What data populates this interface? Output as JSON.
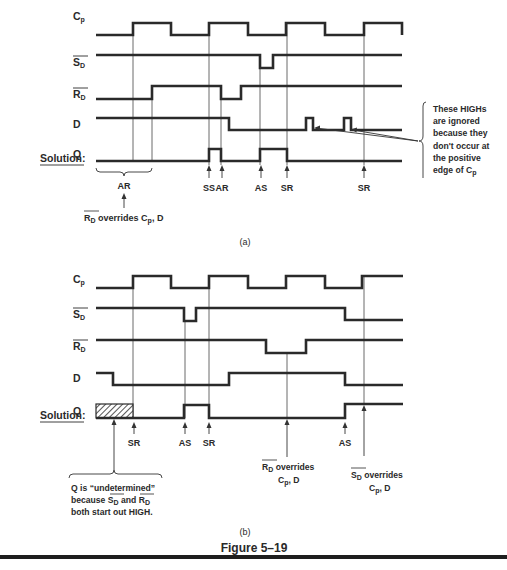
{
  "figure_title": "Figure 5–19",
  "colors": {
    "ink": "#2a2a2a",
    "background": "#ffffff"
  },
  "part_a": {
    "caption": "(a)",
    "solution_label": "Solution:",
    "signals": [
      {
        "name": "Cp",
        "label_main": "C",
        "label_sub": "p",
        "overbar": false,
        "label_y": 20,
        "points": [
          [
            96,
            35
          ],
          [
            133,
            35
          ],
          [
            133,
            23
          ],
          [
            171,
            23
          ],
          [
            171,
            35
          ],
          [
            209,
            35
          ],
          [
            209,
            23
          ],
          [
            248,
            23
          ],
          [
            248,
            35
          ],
          [
            286,
            35
          ],
          [
            286,
            23
          ],
          [
            325,
            23
          ],
          [
            325,
            35
          ],
          [
            364,
            35
          ],
          [
            364,
            23
          ],
          [
            402,
            23
          ],
          [
            402,
            35
          ]
        ]
      },
      {
        "name": "SD_bar",
        "label_main": "S",
        "label_sub": "D",
        "overbar": true,
        "label_y": 66,
        "points": [
          [
            96,
            55
          ],
          [
            260,
            55
          ],
          [
            260,
            68
          ],
          [
            273,
            68
          ],
          [
            273,
            55
          ],
          [
            402,
            55
          ]
        ]
      },
      {
        "name": "RD_bar",
        "label_main": "R",
        "label_sub": "D",
        "overbar": true,
        "label_y": 98,
        "points": [
          [
            96,
            99
          ],
          [
            152,
            99
          ],
          [
            152,
            86
          ],
          [
            221,
            86
          ],
          [
            221,
            99
          ],
          [
            241,
            99
          ],
          [
            241,
            86
          ],
          [
            402,
            86
          ]
        ]
      },
      {
        "name": "D",
        "label_main": "D",
        "label_sub": "",
        "overbar": false,
        "label_y": 128,
        "points": [
          [
            96,
            118
          ],
          [
            229,
            118
          ],
          [
            229,
            130
          ],
          [
            306,
            130
          ],
          [
            306,
            118
          ],
          [
            313,
            118
          ],
          [
            313,
            130
          ],
          [
            344,
            130
          ],
          [
            344,
            118
          ],
          [
            351,
            118
          ],
          [
            351,
            130
          ],
          [
            402,
            130
          ]
        ]
      },
      {
        "name": "Q",
        "label_main": "Q",
        "label_sub": "",
        "overbar": false,
        "label_y": 158,
        "points": [
          [
            96,
            161
          ],
          [
            209,
            161
          ],
          [
            209,
            149
          ],
          [
            221,
            149
          ],
          [
            221,
            161
          ],
          [
            260,
            161
          ],
          [
            260,
            149
          ],
          [
            287,
            149
          ],
          [
            287,
            161
          ],
          [
            402,
            161
          ]
        ]
      }
    ],
    "guides": [
      {
        "x": 133,
        "y1": 35,
        "y2": 161
      },
      {
        "x": 152,
        "y1": 99,
        "y2": 161
      },
      {
        "x": 209,
        "y1": 23,
        "y2": 165
      },
      {
        "x": 221,
        "y1": 99,
        "y2": 165
      },
      {
        "x": 260,
        "y1": 68,
        "y2": 165
      },
      {
        "x": 287,
        "y1": 23,
        "y2": 165
      },
      {
        "x": 364,
        "y1": 23,
        "y2": 165
      }
    ],
    "event_labels": [
      {
        "text": "SS",
        "x": 209,
        "arrow_y1": 178,
        "arrow_y2": 165,
        "label_y": 191
      },
      {
        "text": "AR",
        "x": 222,
        "arrow_y1": 178,
        "arrow_y2": 165,
        "label_y": 191
      },
      {
        "text": "AS",
        "x": 261,
        "arrow_y1": 178,
        "arrow_y2": 165,
        "label_y": 191
      },
      {
        "text": "SR",
        "x": 287,
        "arrow_y1": 178,
        "arrow_y2": 165,
        "label_y": 191
      },
      {
        "text": "SR",
        "x": 364,
        "arrow_y1": 178,
        "arrow_y2": 165,
        "label_y": 191
      }
    ],
    "brace_ar": {
      "x1": 96,
      "x2": 152,
      "y": 172,
      "label": "AR",
      "label_y": 187
    },
    "rd_override_note": {
      "main": "R",
      "sub": "D",
      "text": " overrides C",
      "text_sub": "p",
      "tail": ", D",
      "arrow_x": 124
    },
    "ignored_note": {
      "lines": [
        "These HIGHs",
        "are ignored",
        "because they",
        "don't occur at",
        "the positive",
        "edge of C"
      ],
      "last_sub": "p"
    }
  },
  "part_b": {
    "caption": "(b)",
    "solution_label": "Solution:",
    "signals": [
      {
        "name": "Cp",
        "label_main": "C",
        "label_sub": "p",
        "overbar": false,
        "label_y": 283,
        "points": [
          [
            96,
            288
          ],
          [
            133,
            288
          ],
          [
            133,
            276
          ],
          [
            171,
            276
          ],
          [
            171,
            288
          ],
          [
            209,
            288
          ],
          [
            209,
            276
          ],
          [
            248,
            276
          ],
          [
            248,
            288
          ],
          [
            286,
            288
          ],
          [
            286,
            276
          ],
          [
            325,
            276
          ],
          [
            325,
            288
          ],
          [
            362,
            288
          ],
          [
            362,
            276
          ],
          [
            403,
            276
          ]
        ]
      },
      {
        "name": "SD_bar",
        "label_main": "S",
        "label_sub": "D",
        "overbar": true,
        "label_y": 318,
        "points": [
          [
            96,
            308
          ],
          [
            184,
            308
          ],
          [
            184,
            321
          ],
          [
            196,
            321
          ],
          [
            196,
            308
          ],
          [
            345,
            308
          ],
          [
            345,
            320
          ],
          [
            403,
            320
          ]
        ]
      },
      {
        "name": "RD_bar",
        "label_main": "R",
        "label_sub": "D",
        "overbar": true,
        "label_y": 350,
        "points": [
          [
            96,
            340
          ],
          [
            266,
            340
          ],
          [
            266,
            353
          ],
          [
            306,
            353
          ],
          [
            306,
            340
          ],
          [
            403,
            340
          ]
        ]
      },
      {
        "name": "D",
        "label_main": "D",
        "label_sub": "",
        "overbar": false,
        "label_y": 382,
        "points": [
          [
            96,
            373
          ],
          [
            113,
            373
          ],
          [
            113,
            385
          ],
          [
            229,
            385
          ],
          [
            229,
            373
          ],
          [
            345,
            373
          ],
          [
            345,
            385
          ],
          [
            403,
            385
          ]
        ]
      },
      {
        "name": "Q",
        "label_main": "Q",
        "label_sub": "",
        "overbar": false,
        "label_y": 415,
        "points": [
          [
            96,
            418
          ],
          [
            184,
            418
          ],
          [
            184,
            405
          ],
          [
            209,
            405
          ],
          [
            209,
            418
          ],
          [
            345,
            418
          ],
          [
            345,
            404
          ],
          [
            403,
            404
          ]
        ]
      }
    ],
    "hatch": {
      "x": 96,
      "y": 404,
      "w": 37,
      "h": 14
    },
    "guides": [
      {
        "x": 133,
        "y1": 288,
        "y2": 418
      },
      {
        "x": 185,
        "y1": 321,
        "y2": 418
      },
      {
        "x": 209,
        "y1": 276,
        "y2": 418
      },
      {
        "x": 287,
        "y1": 353,
        "y2": 418
      },
      {
        "x": 364,
        "y1": 276,
        "y2": 404
      }
    ],
    "event_labels": [
      {
        "text": "SR",
        "x": 134,
        "arrow_y1": 434,
        "arrow_y2": 422,
        "label_y": 446
      },
      {
        "text": "AS",
        "x": 185,
        "arrow_y1": 434,
        "arrow_y2": 422,
        "label_y": 446
      },
      {
        "text": "SR",
        "x": 209,
        "arrow_y1": 434,
        "arrow_y2": 422,
        "label_y": 446
      },
      {
        "text": "AS",
        "x": 345,
        "arrow_y1": 434,
        "arrow_y2": 422,
        "label_y": 446
      }
    ],
    "undetermined_note": {
      "line1": "Q is “undetermined”",
      "line2_a": "because ",
      "line2_s": "S",
      "line2_b": " and ",
      "line2_r": "R",
      "line2_sub": "D",
      "line3": "both start out HIGH."
    },
    "rd_override": {
      "main": "R",
      "sub": "D",
      "text": " overrides",
      "line2": "C",
      "line2_sub": "p",
      "line2_tail": ", D"
    },
    "sd_override": {
      "main": "S",
      "sub": "D",
      "text": " overrides",
      "line2": "C",
      "line2_sub": "p",
      "line2_tail": ", D"
    }
  }
}
